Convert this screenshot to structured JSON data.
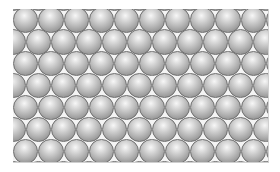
{
  "figure": {
    "frame": {
      "x": 13,
      "y": 9,
      "width": 255,
      "height": 153
    },
    "sphere_diameter": 25.3,
    "row_pitch": 21.9,
    "rows": 7,
    "spheres_per_row": 10,
    "first_row_center_y": 20,
    "first_row_center_x": 12.6,
    "alternate_row_offset": 12.6,
    "colors": {
      "highlight": "#f7f7f7",
      "mid": "#b4b4b4",
      "edge": "#777777",
      "outline": "#6e6e6e",
      "gap": "#f4f4f4"
    }
  }
}
